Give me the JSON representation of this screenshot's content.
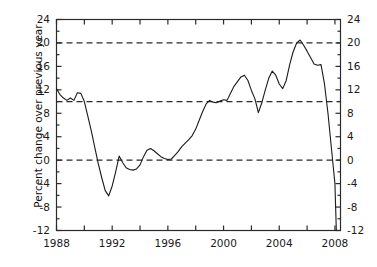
{
  "chart_data": {
    "type": "line",
    "title": "",
    "subtitle": "",
    "xlabel": "",
    "ylabel": "Percent change over previous year",
    "xlim": [
      1988,
      2008.4
    ],
    "ylim": [
      -12,
      24
    ],
    "yticks": [
      24,
      20,
      16,
      12,
      8,
      4,
      0,
      -4,
      -8,
      -12
    ],
    "ytick_labels": [
      "24",
      "20",
      "16",
      "12",
      "8",
      "4",
      "0",
      "-4",
      "-8",
      "-12"
    ],
    "xticks": [
      1988,
      1992,
      1996,
      2000,
      2004,
      2008
    ],
    "xtick_labels": [
      "1988",
      "1992",
      "1996",
      "2000",
      "2004",
      "2008"
    ],
    "x_minor_ticks": [
      1990,
      1994,
      1998,
      2002,
      2006
    ],
    "grid": "dashed horizontal lines at 0, 10, 20",
    "gridlines": [
      0,
      10,
      20
    ],
    "legend": "none",
    "legend_position": "none",
    "right_axis_mirrored": true,
    "line_color": "#1a1a1a",
    "line_width": 1.1,
    "grid_color": "#2b2b2b",
    "axis_color": "#2b2b2b",
    "background": "#ffffff",
    "series": [
      {
        "name": "Percent change over previous year",
        "x": [
          1988.0,
          1988.25,
          1988.5,
          1988.75,
          1989.0,
          1989.25,
          1989.5,
          1989.75,
          1990.0,
          1990.25,
          1990.5,
          1990.75,
          1991.0,
          1991.25,
          1991.5,
          1991.75,
          1992.0,
          1992.25,
          1992.5,
          1992.75,
          1993.0,
          1993.25,
          1993.5,
          1993.75,
          1994.0,
          1994.25,
          1994.5,
          1994.75,
          1995.0,
          1995.25,
          1995.5,
          1995.75,
          1996.0,
          1996.25,
          1996.5,
          1996.75,
          1997.0,
          1997.25,
          1997.5,
          1997.75,
          1998.0,
          1998.25,
          1998.5,
          1998.75,
          1999.0,
          1999.25,
          1999.5,
          1999.75,
          2000.0,
          2000.25,
          2000.5,
          2000.75,
          2001.0,
          2001.25,
          2001.5,
          2001.75,
          2002.0,
          2002.25,
          2002.5,
          2002.75,
          2003.0,
          2003.25,
          2003.5,
          2003.75,
          2004.0,
          2004.25,
          2004.5,
          2004.75,
          2005.0,
          2005.25,
          2005.5,
          2005.75,
          2006.0,
          2006.25,
          2006.5,
          2006.75,
          2007.0,
          2007.25,
          2007.5,
          2007.75,
          2008.0,
          2008.1
        ],
        "values": [
          12.2,
          11.2,
          10.6,
          10.2,
          10.6,
          10.2,
          11.5,
          11.4,
          10.0,
          7.5,
          5.0,
          2.2,
          -0.6,
          -3.0,
          -5.2,
          -6.1,
          -4.4,
          -2.0,
          0.7,
          -0.4,
          -1.3,
          -1.6,
          -1.7,
          -1.5,
          -0.8,
          0.6,
          1.7,
          2.0,
          1.6,
          1.1,
          0.6,
          0.3,
          0.1,
          0.2,
          0.8,
          1.5,
          2.3,
          2.9,
          3.5,
          4.2,
          5.3,
          6.8,
          8.3,
          9.6,
          10.2,
          9.9,
          9.8,
          10.1,
          10.3,
          10.2,
          11.4,
          12.6,
          13.4,
          14.2,
          14.5,
          13.6,
          11.9,
          10.5,
          8.1,
          9.8,
          12.0,
          14.0,
          15.2,
          14.5,
          13.0,
          12.2,
          13.6,
          16.3,
          18.5,
          20.0,
          20.5,
          19.6,
          18.6,
          17.5,
          16.4,
          16.2,
          16.3,
          13.0,
          8.0,
          2.0,
          -4.0,
          -12.0
        ]
      }
    ],
    "annotations": []
  },
  "axes": {
    "y_title": "Percent change over previous year",
    "left_tick_labels": [
      "24",
      "20",
      "16",
      "12",
      "8",
      "4",
      "0",
      "-4",
      "-8",
      "-12"
    ],
    "right_tick_labels": [
      "24",
      "20",
      "16",
      "12",
      "8",
      "4",
      "0",
      "-4",
      "-8",
      "-12"
    ],
    "x_tick_labels": [
      "1988",
      "1992",
      "1996",
      "2000",
      "2004",
      "2008"
    ]
  }
}
